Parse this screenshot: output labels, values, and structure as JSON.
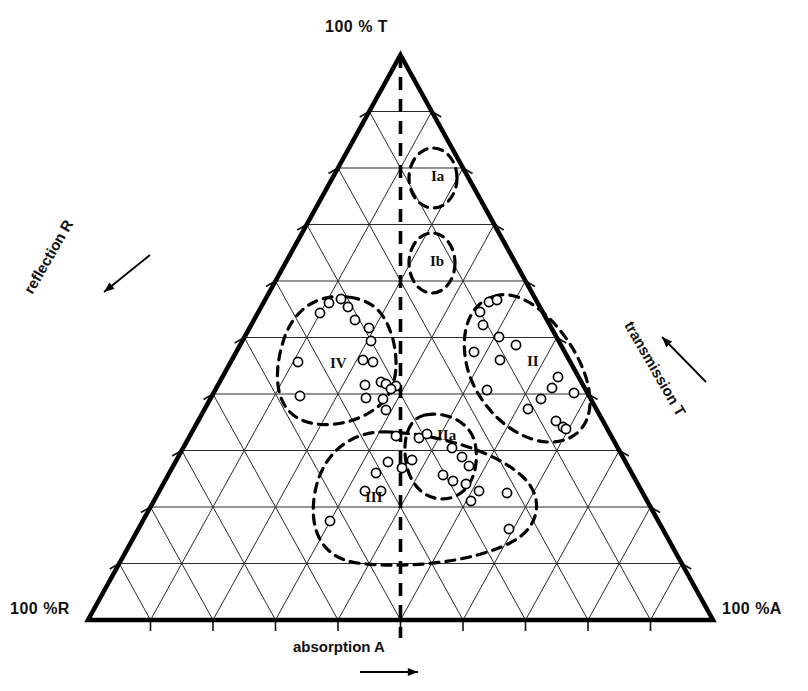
{
  "figure": {
    "type": "ternary-diagram",
    "title": "",
    "vertex_labels": {
      "top": "100 % T",
      "bottom_left": "100 %R",
      "bottom_right": "100 %A"
    },
    "axis_labels": {
      "left": "reflection R",
      "right": "transmission T",
      "bottom": "absorption A"
    },
    "axis_arrow_icons": {
      "left": "arrow-down-left-icon",
      "right": "arrow-up-left-icon",
      "bottom": "arrow-right-icon"
    },
    "grid": {
      "divisions": 10,
      "line_color": "#1a1a1a",
      "outline_color": "#000000",
      "center_line_style": "dashed"
    }
  },
  "chart_data": {
    "type": "scatter",
    "title": "",
    "xlabel": "absorption A",
    "ylabel": "reflection R",
    "zlabel": "transmission T",
    "axis_max": 100,
    "units": "%",
    "grid": true,
    "legend": "none",
    "vertices": {
      "T": "100 % T",
      "R": "100 %R",
      "A": "100 %A"
    },
    "regions": [
      {
        "label": "Ia",
        "shape": "ellipse",
        "cx": 433,
        "cy": 178,
        "rx": 24,
        "ry": 30,
        "rot": 0
      },
      {
        "label": "Ib",
        "shape": "ellipse",
        "cx": 432,
        "cy": 263,
        "rx": 23,
        "ry": 30,
        "rot": 0
      },
      {
        "label": "II",
        "shape": "blob",
        "label_x": 527,
        "label_y": 353
      },
      {
        "label": "IIa",
        "shape": "blob",
        "label_x": 437,
        "label_y": 427
      },
      {
        "label": "III",
        "shape": "blob",
        "label_x": 365,
        "label_y": 489
      },
      {
        "label": "IV",
        "shape": "blob",
        "label_x": 330,
        "label_y": 355
      }
    ],
    "points": [
      {
        "x": 329,
        "y": 303
      },
      {
        "x": 341,
        "y": 299
      },
      {
        "x": 348,
        "y": 307
      },
      {
        "x": 320,
        "y": 313
      },
      {
        "x": 355,
        "y": 320
      },
      {
        "x": 369,
        "y": 328
      },
      {
        "x": 371,
        "y": 341
      },
      {
        "x": 298,
        "y": 362
      },
      {
        "x": 363,
        "y": 360
      },
      {
        "x": 373,
        "y": 362
      },
      {
        "x": 365,
        "y": 385
      },
      {
        "x": 381,
        "y": 382
      },
      {
        "x": 386,
        "y": 384
      },
      {
        "x": 396,
        "y": 386
      },
      {
        "x": 300,
        "y": 396
      },
      {
        "x": 366,
        "y": 398
      },
      {
        "x": 383,
        "y": 399
      },
      {
        "x": 386,
        "y": 410
      },
      {
        "x": 396,
        "y": 436
      },
      {
        "x": 391,
        "y": 389
      },
      {
        "x": 489,
        "y": 302
      },
      {
        "x": 497,
        "y": 300
      },
      {
        "x": 480,
        "y": 312
      },
      {
        "x": 483,
        "y": 325
      },
      {
        "x": 499,
        "y": 337
      },
      {
        "x": 516,
        "y": 345
      },
      {
        "x": 474,
        "y": 352
      },
      {
        "x": 500,
        "y": 360
      },
      {
        "x": 558,
        "y": 377
      },
      {
        "x": 552,
        "y": 388
      },
      {
        "x": 574,
        "y": 393
      },
      {
        "x": 541,
        "y": 399
      },
      {
        "x": 528,
        "y": 409
      },
      {
        "x": 556,
        "y": 421
      },
      {
        "x": 563,
        "y": 427
      },
      {
        "x": 566,
        "y": 429
      },
      {
        "x": 487,
        "y": 390
      },
      {
        "x": 419,
        "y": 438
      },
      {
        "x": 412,
        "y": 460
      },
      {
        "x": 388,
        "y": 462
      },
      {
        "x": 402,
        "y": 468
      },
      {
        "x": 376,
        "y": 473
      },
      {
        "x": 365,
        "y": 491
      },
      {
        "x": 381,
        "y": 491
      },
      {
        "x": 330,
        "y": 521
      },
      {
        "x": 452,
        "y": 448
      },
      {
        "x": 462,
        "y": 457
      },
      {
        "x": 469,
        "y": 466
      },
      {
        "x": 443,
        "y": 475
      },
      {
        "x": 453,
        "y": 481
      },
      {
        "x": 466,
        "y": 484
      },
      {
        "x": 479,
        "y": 491
      },
      {
        "x": 471,
        "y": 501
      },
      {
        "x": 507,
        "y": 493
      },
      {
        "x": 509,
        "y": 529
      },
      {
        "x": 427,
        "y": 434
      }
    ]
  }
}
